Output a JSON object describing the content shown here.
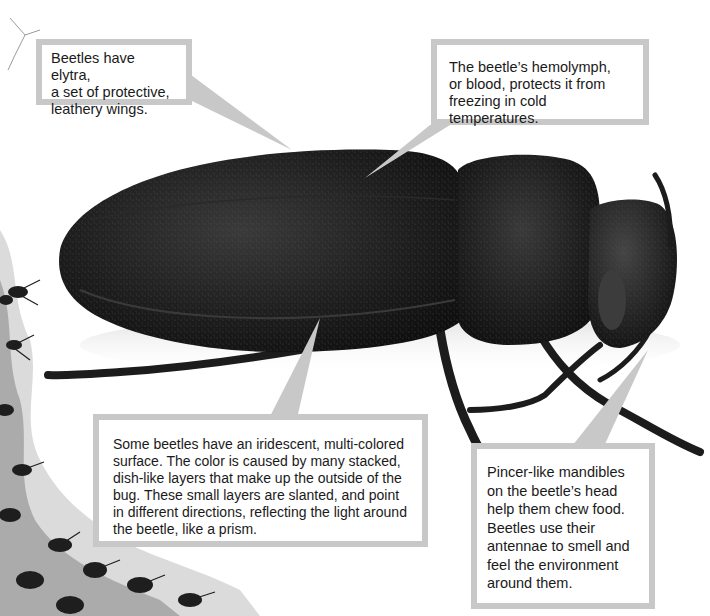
{
  "figure": {
    "colors": {
      "callout_border": "#c8c8c8",
      "callout_bg": "#ffffff",
      "text": "#1a1a1a",
      "beetle": "#1b1b1b"
    },
    "callouts": [
      {
        "id": "elytra",
        "text": "Beetles have elytra,\na set of protective,\nleathery wings."
      },
      {
        "id": "hemolymph",
        "text": "The beetle’s hemolymph,\nor blood, protects it from\nfreezing in cold temperatures."
      },
      {
        "id": "iridescent",
        "text": "Some beetles have an iridescent, multi-colored\nsurface. The color is caused by many stacked,\ndish-like layers that make up the outside of the\nbug. These small layers are slanted, and point\nin different directions, reflecting the light around\nthe beetle, like a prism."
      },
      {
        "id": "mandibles",
        "text": "Pincer-like mandibles\non the beetle’s head\nhelp them chew food.\nBeetles use their\nantennae to smell and\nfeel the environment\naround them."
      }
    ]
  }
}
